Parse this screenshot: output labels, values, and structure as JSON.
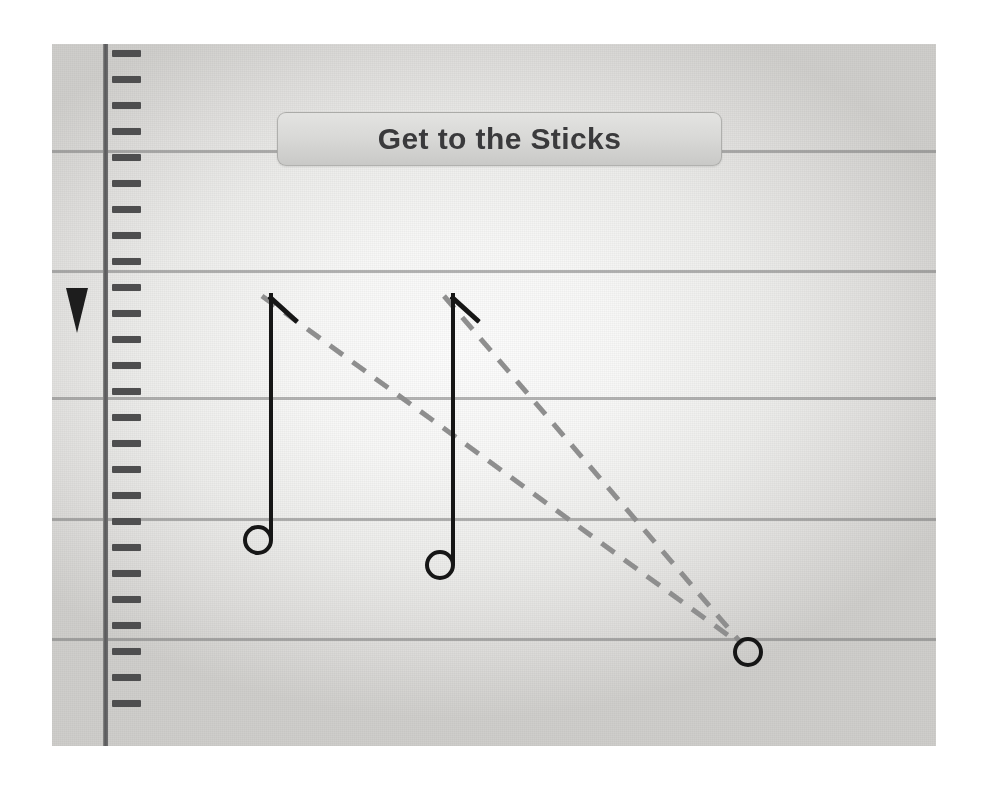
{
  "app": {
    "title": "Get to the Sticks",
    "kind": "music-notation-exercise"
  },
  "banner": {
    "label": "Get to the Sticks"
  },
  "stage": {
    "left": 52,
    "top": 44,
    "width": 884,
    "height": 702,
    "background_center": "#fcfcfc",
    "background_edge": "#cfcecb"
  },
  "staff": {
    "line_color": "#787878",
    "line_thickness_px": 3,
    "line_count": 5,
    "line_y": [
      106,
      226,
      353,
      474,
      594
    ]
  },
  "ruler": {
    "icon": "vertical-ruler",
    "rail_color": "#58585a",
    "tick_color": "#4e4e4f",
    "tick_count": 26,
    "tick_spacing_px": 26,
    "tick_start_y": 6,
    "playhead": {
      "icon": "playhead-triangle-icon",
      "color": "#1d1d1d",
      "y": 244
    }
  },
  "notes": [
    {
      "id": "note-1",
      "name": "notehead-1",
      "head_cx": 206,
      "head_cy": 496,
      "stem_top_y": 249,
      "flag_angle_deg": 42,
      "flag_length": 38,
      "color": "#161616"
    },
    {
      "id": "note-2",
      "name": "notehead-2",
      "head_cx": 388,
      "head_cy": 521,
      "stem_top_y": 249,
      "flag_angle_deg": 42,
      "flag_length": 38,
      "color": "#161616"
    },
    {
      "id": "note-3",
      "name": "notehead-3-target",
      "head_cx": 696,
      "head_cy": 608,
      "stem_top_y": null,
      "flag_angle_deg": null,
      "flag_length": 0,
      "color": "#161616"
    }
  ],
  "guides": [
    {
      "id": "guide-1",
      "name": "dashed-guide-from-note-1",
      "x1": 210,
      "y1": 252,
      "x2": 688,
      "y2": 600,
      "color": "#8e8e8e",
      "dash": "16 12",
      "width": 5
    },
    {
      "id": "guide-2",
      "name": "dashed-guide-from-note-2",
      "x1": 392,
      "y1": 252,
      "x2": 690,
      "y2": 600,
      "color": "#8e8e8e",
      "dash": "16 12",
      "width": 5
    }
  ]
}
